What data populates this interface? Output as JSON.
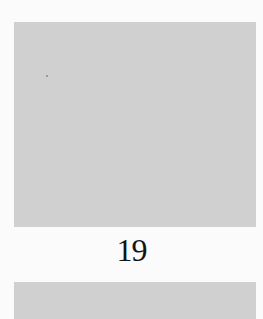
{
  "page": {
    "number": "19"
  },
  "colors": {
    "background": "#fbfbfb",
    "placeholder_gray": "#d0d0d0",
    "text": "#141414"
  }
}
